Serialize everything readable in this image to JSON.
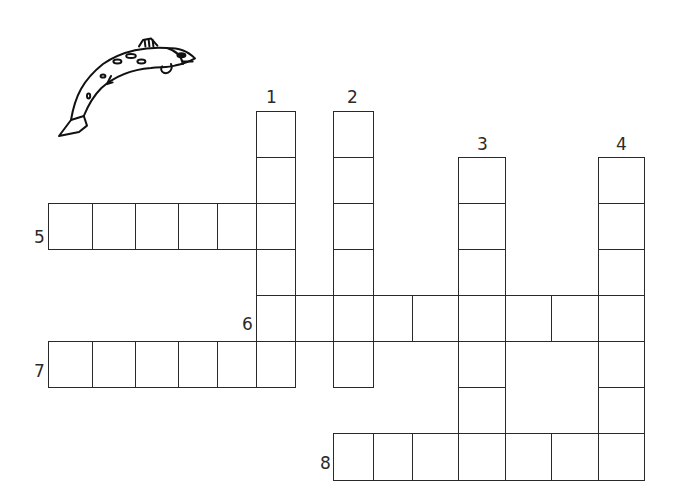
{
  "puzzle": {
    "type": "crossword",
    "line_color": "#2a2a2a",
    "decoration": "fish-illustration",
    "clue_numbers": [
      {
        "label": "1",
        "x": 266,
        "y": 89
      },
      {
        "label": "2",
        "x": 347,
        "y": 89
      },
      {
        "label": "3",
        "x": 477,
        "y": 136
      },
      {
        "label": "4",
        "x": 616,
        "y": 136
      },
      {
        "label": "5",
        "x": 34,
        "y": 229
      },
      {
        "label": "6",
        "x": 242,
        "y": 316
      },
      {
        "label": "7",
        "x": 34,
        "y": 363
      },
      {
        "label": "8",
        "x": 320,
        "y": 455
      }
    ],
    "entries": [
      {
        "number": "1",
        "direction": "down",
        "length": 6
      },
      {
        "number": "2",
        "direction": "down",
        "length": 6
      },
      {
        "number": "3",
        "direction": "down",
        "length": 7
      },
      {
        "number": "4",
        "direction": "down",
        "length": 7
      },
      {
        "number": "5",
        "direction": "across",
        "length": 6
      },
      {
        "number": "6",
        "direction": "across",
        "length": 9
      },
      {
        "number": "7",
        "direction": "across",
        "length": 6
      },
      {
        "number": "8",
        "direction": "across",
        "length": 7
      }
    ],
    "col_edges": [
      48,
      92,
      135,
      178,
      217,
      256,
      295,
      333,
      373,
      412,
      458,
      505,
      551,
      598,
      644
    ],
    "row_edges": [
      111,
      157,
      203,
      249,
      295,
      341,
      387,
      433,
      480
    ],
    "cells": [
      [
        5,
        0
      ],
      [
        5,
        1
      ],
      [
        5,
        2
      ],
      [
        5,
        3
      ],
      [
        5,
        4
      ],
      [
        6,
        0
      ],
      [
        6,
        1
      ],
      [
        6,
        2
      ],
      [
        6,
        3
      ],
      [
        6,
        4
      ],
      [
        7,
        1
      ],
      [
        7,
        2
      ],
      [
        7,
        3
      ],
      [
        7,
        4
      ],
      [
        7,
        5
      ],
      [
        5,
        2
      ],
      [
        7,
        0
      ],
      [
        5,
        5
      ],
      [
        5,
        6
      ],
      [
        5,
        7
      ],
      [
        10,
        4
      ],
      [
        11,
        4
      ],
      [
        12,
        4
      ],
      [
        13,
        4
      ],
      [
        10,
        1
      ],
      [
        10,
        2
      ],
      [
        10,
        3
      ],
      [
        10,
        5
      ],
      [
        10,
        6
      ],
      [
        13,
        1
      ],
      [
        13,
        2
      ],
      [
        13,
        3
      ],
      [
        13,
        5
      ],
      [
        13,
        6
      ],
      [
        0,
        2
      ],
      [
        1,
        2
      ],
      [
        2,
        2
      ],
      [
        3,
        2
      ],
      [
        4,
        2
      ],
      [
        0,
        5
      ],
      [
        1,
        5
      ],
      [
        2,
        5
      ],
      [
        3,
        5
      ],
      [
        4,
        5
      ],
      [
        8,
        7
      ],
      [
        9,
        7
      ],
      [
        10,
        7
      ],
      [
        11,
        7
      ],
      [
        12,
        7
      ],
      [
        13,
        7
      ]
    ]
  }
}
